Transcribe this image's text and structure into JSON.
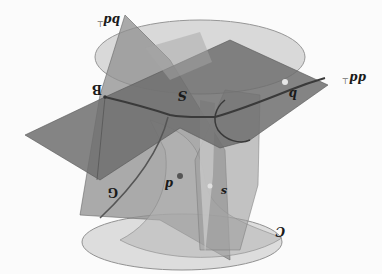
{
  "diagram": {
    "orientation": "rotated 180 degrees",
    "labels": {
      "tangent_plane_top_left": "bd",
      "tangent_plane_top_left_sup": "⊤",
      "tangent_plane_right": "dd",
      "tangent_plane_right_sup": "⊤",
      "point_B": "B",
      "surface_S": "S",
      "point_b": "b",
      "point_p": "d",
      "point_s": "s",
      "curve_G": "G",
      "curve_C": "C"
    },
    "colors": {
      "background": "#fbfbfb",
      "plane_dark": "#6e6e6e",
      "plane_mid": "#8a8a8a",
      "plane_light": "#a3a3a3",
      "ellipse_fill": "#d2d2d2",
      "ellipse_stroke": "#8c8c8c",
      "curve_stroke": "#3c3c3c",
      "point_fill": "#555555",
      "highlight_point": "#e6e6e6"
    }
  }
}
